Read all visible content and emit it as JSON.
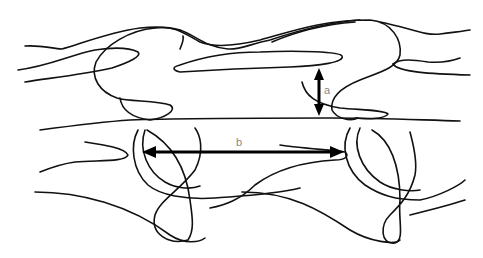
{
  "diagram": {
    "type": "line-drawing",
    "colors": {
      "line": "#111111",
      "arrow": "#000000",
      "label": "#888888",
      "background": "#ffffff"
    },
    "measurements": [
      {
        "id": "a",
        "label": "a",
        "orientation": "vertical",
        "x": 319,
        "y1": 68,
        "y2": 116
      },
      {
        "id": "b",
        "label": "b",
        "orientation": "horizontal",
        "y": 152,
        "x1": 142,
        "x2": 344
      }
    ]
  }
}
